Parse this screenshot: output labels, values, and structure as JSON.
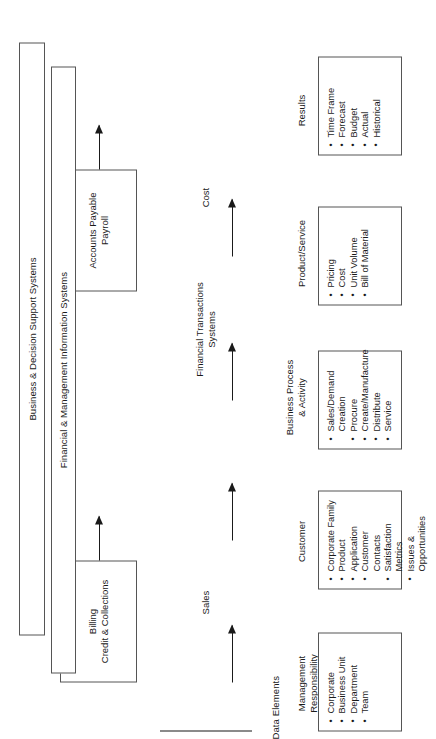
{
  "diagram": {
    "section_heading": "Data Elements",
    "columns": [
      {
        "header": "Management\nResponsibility",
        "items": [
          "Corporate",
          "Business Unit",
          "Department",
          "Team"
        ]
      },
      {
        "header": "Customer",
        "items": [
          "Corporate Family",
          "Product",
          "Application",
          "Customer Contacts",
          "Satisfaction Metrics",
          "Issues & Opportunities"
        ]
      },
      {
        "header": "Business Process\n& Activity",
        "items": [
          "Sales/Demand\nCreation",
          "Procure",
          "Create/Manufacture",
          "Distribute",
          "Service"
        ]
      },
      {
        "header": "Product/Service",
        "items": [
          "Pricing",
          "Cost",
          "Unit Volume",
          "Bill of Material"
        ]
      },
      {
        "header": "Results",
        "items": [
          "Time Frame",
          "Forecast",
          "Budget",
          "Actual",
          "Historical"
        ]
      }
    ],
    "flow_labels": [
      {
        "text": "Sales"
      },
      {
        "text": "Financial Transactions\nSystems"
      },
      {
        "text": "Cost"
      }
    ],
    "system_boxes": [
      {
        "text": "Billing\nCredit & Collections"
      },
      {
        "text": "Accounts Payable\nPayroll"
      }
    ],
    "bars": [
      {
        "text": "Financial & Management Information Systems"
      },
      {
        "text": "Business & Decision Support Systems"
      }
    ]
  },
  "style": {
    "line_color": "#555555",
    "text_color": "#1a1a1a",
    "background": "#ffffff"
  }
}
